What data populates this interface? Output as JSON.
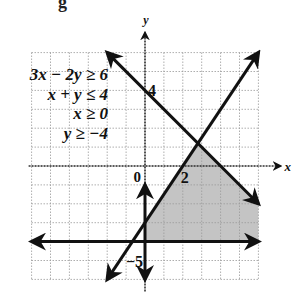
{
  "top_fragment": "g",
  "axes": {
    "x_label": "x",
    "y_label": "y",
    "origin_label": "0",
    "tick_labels": [
      {
        "axis": "y",
        "value": 4,
        "text": "4"
      },
      {
        "axis": "x",
        "value": 2,
        "text": "2"
      },
      {
        "axis": "y",
        "value": -5,
        "text": "−5"
      }
    ],
    "xlim": [
      -6,
      6
    ],
    "ylim": [
      -6,
      6
    ],
    "grid": "dotted, 1 unit"
  },
  "system": {
    "inequalities": [
      "3x − 2y ≥ 6",
      "x + y ≤ 4",
      "x ≥ 0",
      "y ≥ −4"
    ]
  },
  "lines": [
    {
      "name": "x + y = 4",
      "from": [
        -2,
        6
      ],
      "to": [
        6,
        -2
      ]
    },
    {
      "name": "3x − 2y = 6",
      "from": [
        -2,
        -6
      ],
      "to": [
        6,
        6
      ]
    },
    {
      "name": "y = −4",
      "from": [
        -6,
        -4
      ],
      "to": [
        6,
        -4
      ]
    },
    {
      "name": "x = 0",
      "from": [
        0,
        -6
      ],
      "to": [
        0,
        -1
      ]
    }
  ],
  "feasible_region": {
    "vertices": [
      [
        0,
        -4
      ],
      [
        0,
        -3
      ],
      [
        2.8,
        1.2
      ],
      [
        6,
        -2
      ],
      [
        6,
        -4
      ]
    ],
    "fill": "#bdbdbd"
  },
  "colors": {
    "line": "#111111",
    "grid": "#9a9a9a",
    "shade": "#c4c4c4"
  }
}
